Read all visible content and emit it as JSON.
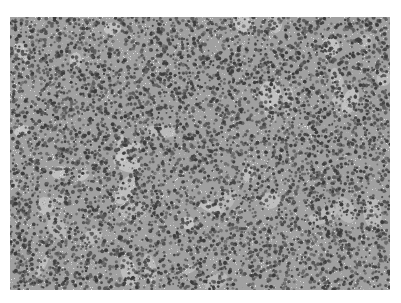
{
  "image": {
    "subject": "grayscale histology micrograph of densely packed small round cells",
    "background_color": "#ffffff",
    "palette": {
      "nucleus_dark": "#3a3a3a",
      "nucleus_mid": "#5e5e5e",
      "stroma_light": "#c8c8c8",
      "base": "#a0a0a0"
    },
    "cell_density": 0.55,
    "light_patch_density": 0.04
  }
}
